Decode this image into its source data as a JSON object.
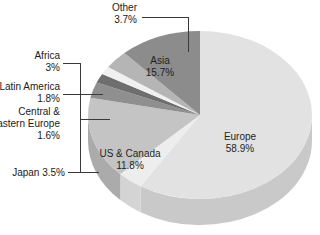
{
  "chart_data": {
    "type": "pie",
    "title": "",
    "subtitle": "",
    "xlabel": "",
    "ylabel": "",
    "legend_position": "none",
    "grid": false,
    "units": "percent",
    "start_angle_deg": 0,
    "direction": "clockwise",
    "three_d": true,
    "categories": [
      "Europe",
      "Other",
      "Asia",
      "Africa",
      "Latin America",
      "Central & Eastern Europe",
      "Japan",
      "US & Canada"
    ],
    "values": [
      58.9,
      3.7,
      15.7,
      3.0,
      1.8,
      1.6,
      3.5,
      11.8
    ],
    "slices": [
      {
        "name": "Europe",
        "label": "Europe",
        "value_label": "58.9%",
        "value": 58.9,
        "color": "#e2e2e2",
        "side_color": "#c9c9c9",
        "label_placement": "inside"
      },
      {
        "name": "Other",
        "label": "Other",
        "value_label": "3.7%",
        "value": 3.7,
        "color": "#ededed",
        "side_color": "#d4d4d4",
        "label_placement": "outside"
      },
      {
        "name": "Asia",
        "label": "Asia",
        "value_label": "15.7%",
        "value": 15.7,
        "color": "#c4c4c4",
        "side_color": "#ababab",
        "label_placement": "inside"
      },
      {
        "name": "Africa",
        "label": "Africa",
        "value_label": "3%",
        "value": 3.0,
        "color": "#8f8f8f",
        "side_color": "#787878",
        "label_placement": "outside"
      },
      {
        "name": "Latin America",
        "label": "Latin America",
        "value_label": "1.8%",
        "value": 1.8,
        "color": "#6e6e6e",
        "side_color": "#5b5b5b",
        "label_placement": "outside"
      },
      {
        "name": "Central & Eastern Europe",
        "label_line1": "Central &",
        "label_line2": "Eastern Europe",
        "value_label": "1.6%",
        "value": 1.6,
        "color": "#f0f0f0",
        "side_color": "#d6d6d6",
        "label_placement": "outside"
      },
      {
        "name": "Japan",
        "label": "Japan 3.5%",
        "value_label": "3.5%",
        "value": 3.5,
        "color": "#b5b5b5",
        "side_color": "#9c9c9c",
        "label_placement": "outside"
      },
      {
        "name": "US & Canada",
        "label": "US & Canada",
        "value_label": "11.8%",
        "value": 11.8,
        "color": "#8c8c8c",
        "side_color": "#747474",
        "label_placement": "inside"
      }
    ]
  },
  "labels": {
    "other_name": "Other",
    "other_pct": "3.7%",
    "africa_name": "Africa",
    "africa_pct": "3%",
    "latin_america_name": "Latin America",
    "latin_america_pct": "1.8%",
    "cee_name_line1": "Central &",
    "cee_name_line2": "Eastern Europe",
    "cee_pct": "1.6%",
    "japan_combined": "Japan 3.5%",
    "asia_name": "Asia",
    "asia_pct": "15.7%",
    "europe_name": "Europe",
    "europe_pct": "58.9%",
    "us_canada_name": "US & Canada",
    "us_canada_pct": "11.8%"
  },
  "colors": {
    "background": "#ffffff",
    "text": "#1a1a1a",
    "leader_line": "#3a3a3a"
  }
}
